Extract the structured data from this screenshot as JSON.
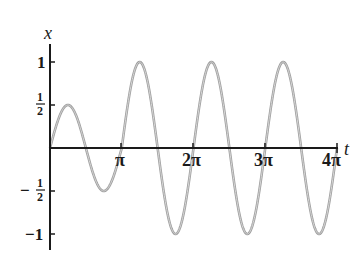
{
  "chart_data": {
    "type": "line",
    "title": "",
    "xlabel": "t",
    "ylabel": "x",
    "x_ticks": [
      "π",
      "2π",
      "3π",
      "4π"
    ],
    "x_tick_values": [
      3.14159,
      6.28319,
      9.42478,
      12.56637
    ],
    "y_ticks": [
      "1",
      "1/2",
      "−1/2",
      "−1"
    ],
    "y_tick_values": [
      1,
      0.5,
      -0.5,
      -1
    ],
    "xlim": [
      0,
      12.566
    ],
    "ylim": [
      -1.1,
      1.1
    ],
    "grid": false,
    "legend": null,
    "series": [
      {
        "name": "x(t)",
        "description": "oscillation with angular frequency 2; amplitude 1/2 for 0 ≤ t ≤ π, amplitude 1 for π < t ≤ 4π",
        "t": [
          0,
          0.785,
          1.571,
          2.356,
          3.142,
          3.927,
          4.712,
          5.498,
          6.283,
          7.069,
          7.854,
          8.639,
          9.425,
          10.21,
          10.996,
          11.781,
          12.566
        ],
        "x": [
          0,
          0.5,
          0,
          -0.5,
          0,
          1,
          0,
          -1,
          0,
          1,
          0,
          -1,
          0,
          1,
          0,
          -1,
          0
        ]
      }
    ]
  },
  "labels": {
    "y_axis": "x",
    "x_axis": "t",
    "tick_pi": "π",
    "tick_2pi": "2π",
    "tick_3pi": "3π",
    "tick_4pi": "4π",
    "tick_one": "1",
    "tick_neg_one": "−1",
    "tick_half_num": "1",
    "tick_half_den": "2",
    "tick_neg_sign": "−"
  },
  "colors": {
    "axis": "#1a1a1a",
    "curve": "#9a9a9a"
  }
}
